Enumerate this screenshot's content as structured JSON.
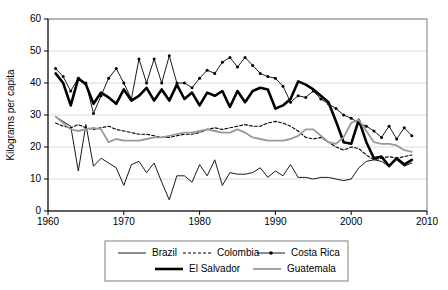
{
  "chart_data": {
    "type": "line",
    "title": "",
    "xlabel": "",
    "ylabel": "Kilograms per capita",
    "xlim": [
      1960,
      2010
    ],
    "ylim": [
      0,
      60
    ],
    "xticks": [
      1960,
      1970,
      1980,
      1990,
      2000,
      2010
    ],
    "yticks": [
      0,
      10,
      20,
      30,
      40,
      50,
      60
    ],
    "grid": "horizontal",
    "legend_position": "bottom",
    "x": [
      1961,
      1962,
      1963,
      1964,
      1965,
      1966,
      1967,
      1968,
      1969,
      1970,
      1971,
      1972,
      1973,
      1974,
      1975,
      1976,
      1977,
      1978,
      1979,
      1980,
      1981,
      1982,
      1983,
      1984,
      1985,
      1986,
      1987,
      1988,
      1989,
      1990,
      1991,
      1992,
      1993,
      1994,
      1995,
      1996,
      1997,
      1998,
      1999,
      2000,
      2001,
      2002,
      2003,
      2004,
      2005,
      2006,
      2007,
      2008
    ],
    "series": [
      {
        "name": "Brazil",
        "color": "#000000",
        "width": 0.9,
        "dash": "none",
        "marker": "none",
        "values": [
          29.5,
          28.0,
          26.5,
          12.5,
          27.0,
          14.0,
          16.5,
          15.0,
          13.5,
          8.0,
          14.5,
          15.5,
          12.0,
          15.0,
          9.0,
          3.5,
          11.0,
          11.0,
          9.0,
          14.5,
          11.0,
          16.0,
          8.0,
          12.0,
          11.5,
          11.5,
          12.0,
          13.5,
          10.5,
          12.5,
          11.0,
          14.5,
          10.5,
          10.5,
          10.0,
          10.5,
          10.5,
          10.0,
          9.5,
          10.0,
          13.5,
          15.5,
          16.0,
          15.5,
          14.0,
          16.0,
          14.0,
          15.0
        ]
      },
      {
        "name": "Colombia",
        "color": "#000000",
        "width": 1.1,
        "dash": "3,2",
        "marker": "none",
        "values": [
          27.5,
          26.5,
          26.0,
          27.0,
          26.0,
          25.5,
          26.0,
          26.5,
          25.5,
          25.0,
          24.5,
          24.0,
          24.0,
          23.5,
          23.0,
          23.0,
          23.5,
          24.0,
          24.0,
          24.5,
          25.5,
          26.0,
          25.5,
          26.0,
          26.5,
          27.0,
          26.5,
          26.5,
          27.5,
          28.0,
          27.5,
          26.5,
          25.0,
          23.0,
          22.5,
          23.0,
          21.5,
          20.0,
          19.0,
          20.0,
          19.5,
          17.5,
          16.0,
          16.5,
          17.0,
          16.5,
          17.0,
          17.5
        ]
      },
      {
        "name": "Costa Rica",
        "color": "#000000",
        "width": 0.9,
        "dash": "none",
        "marker": "dot",
        "values": [
          44.5,
          42.0,
          37.5,
          41.5,
          40.0,
          30.5,
          36.0,
          41.5,
          44.5,
          40.0,
          35.0,
          47.5,
          40.0,
          47.5,
          40.0,
          48.5,
          40.0,
          40.0,
          38.5,
          41.5,
          44.0,
          43.0,
          46.5,
          48.0,
          45.0,
          48.0,
          45.5,
          43.0,
          42.0,
          41.5,
          39.0,
          34.0,
          36.0,
          35.5,
          37.5,
          35.0,
          33.5,
          32.0,
          30.0,
          29.0,
          27.5,
          26.5,
          25.0,
          23.0,
          26.5,
          22.5,
          26.0,
          23.5
        ]
      },
      {
        "name": "El Salvador",
        "color": "#000000",
        "width": 2.6,
        "dash": "none",
        "marker": "none",
        "values": [
          43.0,
          40.0,
          33.0,
          41.5,
          39.5,
          33.5,
          37.0,
          35.5,
          33.5,
          38.0,
          34.5,
          36.0,
          38.5,
          34.5,
          38.0,
          34.5,
          39.5,
          35.0,
          37.0,
          33.0,
          37.0,
          36.0,
          37.5,
          32.5,
          37.5,
          34.0,
          37.5,
          38.5,
          38.0,
          32.0,
          33.0,
          35.0,
          40.5,
          39.5,
          38.0,
          36.0,
          34.0,
          28.0,
          21.5,
          21.0,
          28.5,
          21.5,
          16.5,
          17.0,
          14.0,
          16.5,
          14.5,
          16.0
        ]
      },
      {
        "name": "Guatemala",
        "color": "#9a9a9a",
        "width": 1.8,
        "dash": "none",
        "marker": "none",
        "values": [
          29.5,
          27.5,
          25.5,
          25.0,
          25.5,
          26.0,
          25.5,
          21.5,
          22.5,
          22.0,
          22.0,
          22.0,
          22.5,
          23.0,
          23.0,
          23.5,
          24.0,
          24.5,
          24.5,
          25.0,
          25.5,
          25.0,
          24.5,
          24.5,
          25.5,
          24.5,
          23.0,
          22.5,
          22.0,
          22.0,
          22.0,
          22.5,
          23.5,
          25.5,
          25.5,
          23.5,
          21.5,
          21.0,
          23.0,
          27.5,
          28.5,
          25.0,
          21.5,
          21.0,
          21.0,
          20.5,
          19.0,
          18.5
        ]
      }
    ]
  },
  "legend": {
    "entries": [
      {
        "label": "Brazil",
        "style": "thin-solid-black"
      },
      {
        "label": "Colombia",
        "style": "dashed-black"
      },
      {
        "label": "Costa Rica",
        "style": "solid-black-marker"
      },
      {
        "label": "El Salvador",
        "style": "thick-solid-black"
      },
      {
        "label": "Guatemala",
        "style": "solid-gray"
      }
    ]
  }
}
